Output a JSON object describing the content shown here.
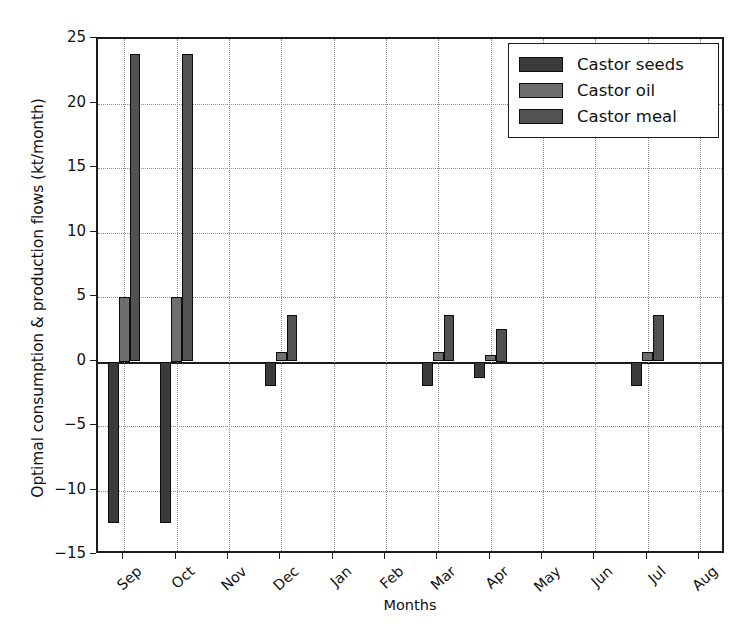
{
  "chart_data": {
    "type": "bar",
    "title": "",
    "xlabel": "Months",
    "ylabel": "Optimal consumption & production flows (kt/month)",
    "categories": [
      "Sep",
      "Oct",
      "Nov",
      "Dec",
      "Jan",
      "Feb",
      "Mar",
      "Apr",
      "May",
      "Jun",
      "Jul",
      "Aug"
    ],
    "series": [
      {
        "name": "Castor seeds",
        "color": "#3b3b3b",
        "values": [
          -12.5,
          -12.5,
          0,
          -1.9,
          0,
          0,
          -1.9,
          -1.3,
          0,
          0,
          -1.9,
          0
        ]
      },
      {
        "name": "Castor oil",
        "color": "#6e6e6e",
        "values": [
          5.0,
          5.0,
          0,
          0.75,
          0,
          0,
          0.75,
          0.5,
          0,
          0,
          0.75,
          0
        ]
      },
      {
        "name": "Castor meal",
        "color": "#525252",
        "values": [
          23.8,
          23.8,
          0,
          3.6,
          0,
          0,
          3.6,
          2.5,
          0,
          0,
          3.6,
          0
        ]
      }
    ],
    "ylim": [
      -15,
      25
    ],
    "yticks": [
      -15,
      -10,
      -5,
      0,
      5,
      10,
      15,
      20,
      25
    ],
    "ytick_labels": [
      "−15",
      "−10",
      "−5",
      "0",
      "5",
      "10",
      "15",
      "20",
      "25"
    ],
    "grid": "dotted-both-axes",
    "legend_position": "upper-right",
    "xtick_rotation": "-45"
  },
  "legend": {
    "entries": [
      {
        "label": "Castor seeds",
        "color": "#3b3b3b"
      },
      {
        "label": "Castor oil",
        "color": "#6e6e6e"
      },
      {
        "label": "Castor meal",
        "color": "#525252"
      }
    ]
  }
}
